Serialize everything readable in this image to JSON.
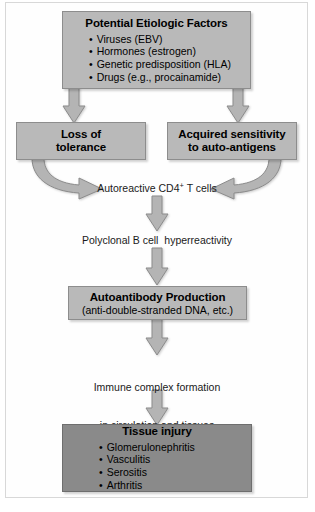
{
  "diagram": {
    "colors": {
      "box_light": "#b9b9b9",
      "box_dark": "#8a8a8a",
      "arrow": "#b4b4b4",
      "border": "#8d8d8d",
      "background": "#ffffff",
      "text": "#000000"
    },
    "nodes": {
      "etiologic_factors": {
        "title": "Potential Etiologic Factors",
        "items": [
          "Viruses (EBV)",
          "Hormones (estrogen)",
          "Genetic predisposition (HLA)",
          "Drugs (e.g., procainamide)"
        ]
      },
      "loss_of_tolerance": {
        "line1": "Loss of",
        "line2": "tolerance"
      },
      "acquired_sensitivity": {
        "line1": "Acquired sensitivity",
        "line2": "to auto-antigens"
      },
      "autoreactive_t_cells": {
        "text_before": "Autoreactive CD4",
        "superscript": "+",
        "text_after": " T cells"
      },
      "polyclonal_b_cell": {
        "text": "Polyclonal B cell  hyperreactivity"
      },
      "autoantibody_production": {
        "title": "Autoantibody Production",
        "subtitle": "(anti-double-stranded DNA, etc.)"
      },
      "immune_complex": {
        "line1": "Immune complex formation",
        "line2": "in circulation and tissues"
      },
      "tissue_injury": {
        "title": "Tissue injury",
        "items": [
          "Glomerulonephritis",
          "Vasculitis",
          "Serositis",
          "Arthritis"
        ]
      }
    }
  }
}
